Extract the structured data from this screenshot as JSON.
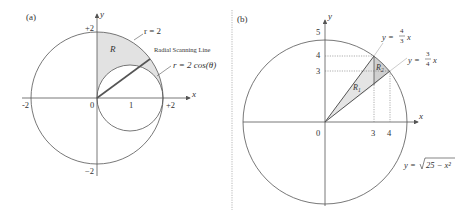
{
  "panel_a": {
    "label": "(a)",
    "axis_x": "x",
    "axis_y": "y",
    "tick_x_neg": "-2",
    "tick_x_zero": "0",
    "tick_x_one": "1",
    "tick_x_pos": "+2",
    "tick_y_pos": "+2",
    "tick_y_neg": "−2",
    "region": "R",
    "circle_label": "r = 2",
    "scan_label": "Radial Scanning Line",
    "inner_label": "r = 2 cos(θ)"
  },
  "panel_b": {
    "label": "(b)",
    "axis_x": "x",
    "axis_y": "y",
    "tick_y5": "5",
    "tick_y4": "4",
    "tick_y3": "3",
    "tick_x0": "0",
    "tick_x3": "3",
    "tick_x4": "4",
    "region1": "R",
    "region1_sub": "1",
    "region2": "R",
    "region2_sub": "2",
    "line1_lhs": "y =",
    "line1_num": "4",
    "line1_den": "3",
    "line1_var": "x",
    "line2_lhs": "y =",
    "line2_num": "3",
    "line2_den": "4",
    "line2_var": "x",
    "curve_lhs": "y =",
    "curve_rad": "25 − x²"
  },
  "colors": {
    "stroke": "#555555",
    "shade": "#e2e2e2",
    "shade_dark": "#cfcfcf",
    "divider": "#999999"
  }
}
